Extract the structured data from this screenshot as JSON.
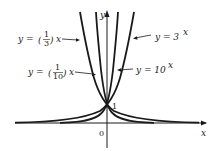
{
  "figure": {
    "type": "function-graph",
    "axes": {
      "x_label": "x",
      "y_label": "y",
      "origin_label": "0",
      "intercept_label": "1"
    },
    "curves": [
      {
        "id": "one-third",
        "label_lhs": "y =",
        "label_num": "1",
        "label_den": "3",
        "label_rhs": "x",
        "base": 0.3333
      },
      {
        "id": "one-tenth",
        "label_lhs": "y =",
        "label_num": "1",
        "label_den": "10",
        "label_rhs": "x",
        "base": 0.1
      },
      {
        "id": "three",
        "label": "y = 3",
        "exp": "x",
        "base": 3
      },
      {
        "id": "ten",
        "label": "y = 10",
        "exp": "x",
        "base": 10
      }
    ],
    "stroke_color": "#1a1a1a"
  }
}
